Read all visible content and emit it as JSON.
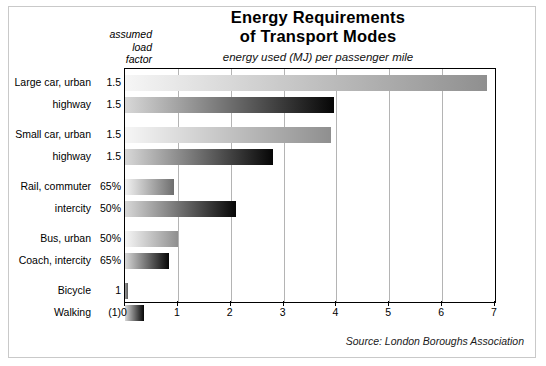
{
  "figure": {
    "width": 546,
    "height": 366,
    "background": "#ffffff",
    "frame_color": "#c9c9c9"
  },
  "header": {
    "title_line1": "Energy Requirements",
    "title_line2": "of Transport Modes",
    "subtitle": "energy used (MJ) per passenger mile",
    "load_header_line1": "assumed",
    "load_header_line2": "load",
    "load_header_line3": "factor"
  },
  "source": {
    "text": "Source: London Boroughs Association"
  },
  "chart_data": {
    "type": "bar",
    "orientation": "horizontal",
    "title": "Energy Requirements of Transport Modes",
    "subtitle": "energy used (MJ) per passenger mile",
    "xlabel": "",
    "ylabel": "",
    "xlim": [
      0,
      7
    ],
    "xticks": [
      0,
      1,
      2,
      3,
      4,
      5,
      6,
      7
    ],
    "xtick_labels": [
      "0",
      "1",
      "2",
      "3",
      "4",
      "5",
      "6",
      "7"
    ],
    "grid": "vertical",
    "legend": "none",
    "categories": [
      "Large car, urban",
      "highway",
      "Small car, urban",
      "highway",
      "Rail, commuter",
      "intercity",
      "Bus, urban",
      "Coach, intercity",
      "Bicycle",
      "Walking"
    ],
    "load_factors": [
      "1.5",
      "1.5",
      "1.5",
      "1.5",
      "65%",
      "50%",
      "50%",
      "65%",
      "1",
      "(1)"
    ],
    "values": [
      6.85,
      3.95,
      3.9,
      2.8,
      0.93,
      2.1,
      1.0,
      0.84,
      0.06,
      0.36
    ],
    "series": [
      {
        "name": "energy used (MJ) per passenger mile",
        "values": [
          6.85,
          3.95,
          3.9,
          2.8,
          0.93,
          2.1,
          1.0,
          0.84,
          0.06,
          0.36
        ]
      }
    ],
    "bar_shades": [
      "light",
      "dark",
      "light",
      "dark",
      "mid",
      "dark",
      "light",
      "dark",
      "tiny",
      "dark"
    ],
    "group_gaps_after": [
      1,
      3,
      5,
      7
    ]
  },
  "colors": {
    "axis": "#000000",
    "gridline": "#b4b4b4",
    "bar_light_start": "#f6f6f6",
    "bar_light_end": "#8f8f8f",
    "bar_dark_start": "#d8d8d8",
    "bar_dark_end": "#060606",
    "bar_mid_start": "#f2f2f2",
    "bar_mid_end": "#6e6e6e"
  }
}
